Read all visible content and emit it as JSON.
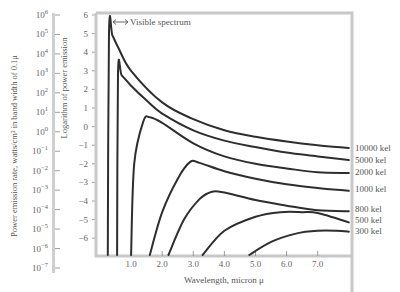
{
  "chart_data": {
    "type": "line",
    "title": "",
    "annotation": "Visible spectrum",
    "annotation_icon": "double-arrow",
    "xlabel": "Wavelength, micron μ",
    "ylabel_left": "Power emission rate, watts/cm² in band width of 0.1μ",
    "ylabel_right": "Logarithm of power emission",
    "xlim": [
      0,
      8
    ],
    "ylim": [
      -7,
      6
    ],
    "x_ticks": [
      "1.0",
      "2.0",
      "3.0",
      "4.0",
      "5.0",
      "6.0",
      "7.0"
    ],
    "log_ticks": [
      "6",
      "5",
      "4",
      "3",
      "2",
      "1",
      "0",
      "-1",
      "-2",
      "-3",
      "-4",
      "-5",
      "-6"
    ],
    "power_ticks": [
      "10^6",
      "10^5",
      "10^4",
      "10^3",
      "10^2",
      "10^1",
      "10^0",
      "10^-1",
      "10^-2",
      "10^-3",
      "10^-4",
      "10^-5",
      "10^-6",
      "10^-7"
    ],
    "grid": false,
    "legend_position": "right-inline",
    "series": [
      {
        "name": "10000 kel",
        "x": [
          0.25,
          0.29,
          0.4,
          0.6,
          1.0,
          2.0,
          3.0,
          4.0,
          5.0,
          6.0,
          7.0,
          8.0
        ],
        "values": [
          -7.0,
          5.1,
          4.9,
          4.2,
          3.0,
          1.3,
          0.4,
          -0.2,
          -0.55,
          -0.8,
          -1.0,
          -1.15
        ]
      },
      {
        "name": "5000 kel",
        "x": [
          0.55,
          0.58,
          0.7,
          1.0,
          1.5,
          2.0,
          3.0,
          4.0,
          5.0,
          6.0,
          7.0,
          8.0
        ],
        "values": [
          -7.0,
          2.9,
          2.75,
          2.2,
          1.4,
          0.7,
          -0.2,
          -0.75,
          -1.1,
          -1.4,
          -1.6,
          -1.8
        ]
      },
      {
        "name": "2000 kel",
        "x": [
          1.0,
          1.1,
          1.4,
          1.6,
          2.0,
          3.0,
          4.0,
          5.0,
          6.0,
          7.0,
          8.0
        ],
        "values": [
          -7.0,
          -2.0,
          0.3,
          0.5,
          0.2,
          -0.9,
          -1.6,
          -2.0,
          -2.25,
          -2.45,
          -2.5
        ]
      },
      {
        "name": "1000 kel",
        "x": [
          1.6,
          2.0,
          2.5,
          2.9,
          3.2,
          4.0,
          5.0,
          6.0,
          7.0,
          8.0
        ],
        "values": [
          -7.0,
          -4.6,
          -2.8,
          -1.9,
          -1.95,
          -2.4,
          -2.8,
          -3.1,
          -3.3,
          -3.45
        ]
      },
      {
        "name": "800 kel",
        "x": [
          2.2,
          2.7,
          3.2,
          3.6,
          4.0,
          5.0,
          6.0,
          7.0,
          8.0
        ],
        "values": [
          -7.0,
          -5.0,
          -3.9,
          -3.5,
          -3.55,
          -3.95,
          -4.25,
          -4.5,
          -4.55
        ]
      },
      {
        "name": "500 kel",
        "x": [
          3.3,
          4.0,
          5.0,
          5.8,
          6.5,
          7.0,
          8.0
        ],
        "values": [
          -7.0,
          -5.6,
          -4.85,
          -4.6,
          -4.6,
          -4.65,
          -5.15
        ]
      },
      {
        "name": "300 kel",
        "x": [
          4.8,
          5.5,
          6.3,
          7.0,
          7.6,
          8.0
        ],
        "values": [
          -7.0,
          -6.2,
          -5.75,
          -5.6,
          -5.6,
          -5.65
        ]
      }
    ]
  }
}
